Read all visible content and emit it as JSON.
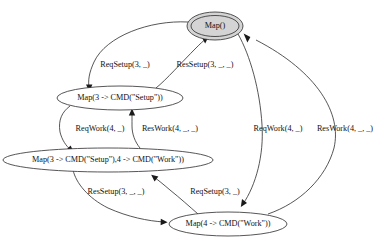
{
  "diagram": {
    "type": "directed-graph",
    "background_color": "#ffffff",
    "stroke_color": "#2b2b2b",
    "accept_fill_color": "#d4d4d4",
    "nodes": [
      {
        "id": "n0",
        "label": "Map()",
        "shape": "doublecircle",
        "is_accepting": true,
        "cx": 215,
        "cy": 26,
        "rx": 28,
        "ry": 14
      },
      {
        "id": "n1",
        "label": "Map(3 -> CMD(\"Setup\"))",
        "shape": "ellipse",
        "is_accepting": false,
        "cx": 120,
        "cy": 98,
        "rx": 63,
        "ry": 12
      },
      {
        "id": "n2",
        "label": "Map(3 -> CMD(\"Setup\"),4 -> CMD(\"Work\"))",
        "shape": "ellipse",
        "is_accepting": false,
        "cx": 108,
        "cy": 160,
        "rx": 105,
        "ry": 12
      },
      {
        "id": "n3",
        "label": "Map(4 -> CMD(\"Work\"))",
        "shape": "ellipse",
        "is_accepting": false,
        "cx": 228,
        "cy": 224,
        "rx": 59,
        "ry": 12
      }
    ],
    "edges": [
      {
        "id": "e0",
        "from": "n0",
        "to": "n1",
        "label": "ReqSetup(3, _)",
        "label_x": 125,
        "label_y": 65
      },
      {
        "id": "e1",
        "from": "n1",
        "to": "n0",
        "label": "ResSetup(3, _, _)",
        "label_x": 205,
        "label_y": 65
      },
      {
        "id": "e2",
        "from": "n1",
        "to": "n2",
        "label": "ReqWork(4, _)",
        "label_x": 100,
        "label_y": 129
      },
      {
        "id": "e3",
        "from": "n2",
        "to": "n1",
        "label": "ResWork(4, _, _)",
        "label_x": 170,
        "label_y": 129
      },
      {
        "id": "e4",
        "from": "n2",
        "to": "n3",
        "label": "ResSetup(3, _, _)",
        "label_x": 116,
        "label_y": 192
      },
      {
        "id": "e5",
        "from": "n3",
        "to": "n2",
        "label": "ReqSetup(3, _)",
        "label_x": 215,
        "label_y": 192
      },
      {
        "id": "e6",
        "from": "n0",
        "to": "n3",
        "label": "ReqWork(4, _)",
        "label_x": 278,
        "label_y": 129
      },
      {
        "id": "e7",
        "from": "n3",
        "to": "n0",
        "label": "ResWork(4, _, _)",
        "label_x": 345,
        "label_y": 129
      }
    ]
  }
}
